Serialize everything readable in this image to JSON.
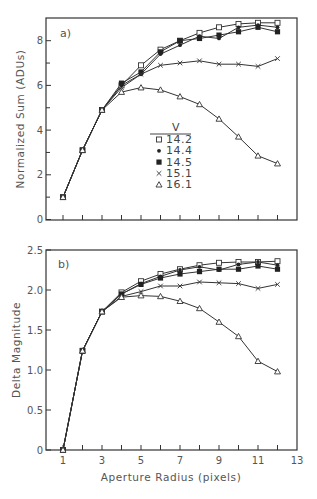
{
  "chart_data": [
    {
      "type": "line",
      "panel_label": "a)",
      "title": "",
      "xlabel": "",
      "ylabel": "Normalized Sum (ADUs)",
      "xlim": [
        0.1,
        13
      ],
      "ylim": [
        0,
        9
      ],
      "yticks": [
        0,
        2,
        4,
        6,
        8
      ],
      "yticks_minor": [
        1,
        3,
        5,
        7
      ],
      "xticks": [
        1,
        2,
        3,
        4,
        5,
        6,
        7,
        8,
        9,
        10,
        11,
        12
      ],
      "grid": false,
      "legend": {
        "title": "V",
        "position": "center",
        "entries": [
          "14.2",
          "14.4",
          "14.5",
          "15.1",
          "16.1"
        ]
      },
      "x": [
        1,
        2,
        3,
        4,
        5,
        6,
        7,
        8,
        9,
        10,
        11,
        12
      ],
      "series": [
        {
          "name": "14.2",
          "marker": "open-square",
          "values": [
            1.0,
            3.1,
            4.9,
            6.0,
            6.9,
            7.6,
            8.0,
            8.35,
            8.6,
            8.75,
            8.8,
            8.8
          ]
        },
        {
          "name": "14.4",
          "marker": "dot",
          "values": [
            1.0,
            3.1,
            4.9,
            6.0,
            6.5,
            7.4,
            7.8,
            8.2,
            8.1,
            8.6,
            8.7,
            8.6
          ]
        },
        {
          "name": "14.5",
          "marker": "filled-square",
          "values": [
            1.0,
            3.1,
            4.9,
            6.1,
            6.6,
            7.5,
            8.0,
            8.1,
            8.25,
            8.4,
            8.6,
            8.4
          ]
        },
        {
          "name": "15.1",
          "marker": "cross",
          "values": [
            1.0,
            3.1,
            4.9,
            5.9,
            6.5,
            6.9,
            7.0,
            7.1,
            6.95,
            6.95,
            6.85,
            7.2
          ]
        },
        {
          "name": "16.1",
          "marker": "open-triangle",
          "values": [
            1.0,
            3.1,
            4.9,
            5.7,
            5.9,
            5.8,
            5.5,
            5.15,
            4.5,
            3.7,
            2.85,
            2.5
          ]
        }
      ]
    },
    {
      "type": "line",
      "panel_label": "b)",
      "title": "",
      "xlabel": "Aperture Radius (pixels)",
      "ylabel": "Delta Magnitude",
      "xlim": [
        0.1,
        13
      ],
      "ylim": [
        0,
        2.5
      ],
      "yticks": [
        0,
        0.5,
        1.0,
        1.5,
        2.0,
        2.5
      ],
      "ytick_labels": [
        "0",
        "0.5",
        "1.0",
        "1.5",
        "2.0",
        "2.5"
      ],
      "xticks": [
        1,
        3,
        5,
        7,
        9,
        11,
        13
      ],
      "xticks_minor": [
        2,
        4,
        6,
        8,
        10,
        12
      ],
      "grid": false,
      "x": [
        1,
        2,
        3,
        4,
        5,
        6,
        7,
        8,
        9,
        10,
        11,
        12
      ],
      "series": [
        {
          "name": "14.2",
          "marker": "open-square",
          "values": [
            0,
            1.24,
            1.73,
            1.97,
            2.11,
            2.2,
            2.26,
            2.31,
            2.34,
            2.35,
            2.35,
            2.36
          ]
        },
        {
          "name": "14.4",
          "marker": "dot",
          "values": [
            0,
            1.24,
            1.73,
            1.95,
            2.08,
            2.17,
            2.25,
            2.29,
            2.25,
            2.32,
            2.35,
            2.31
          ]
        },
        {
          "name": "14.5",
          "marker": "filled-square",
          "values": [
            0,
            1.24,
            1.73,
            1.95,
            2.07,
            2.15,
            2.2,
            2.23,
            2.26,
            2.26,
            2.3,
            2.26
          ]
        },
        {
          "name": "15.1",
          "marker": "cross",
          "values": [
            0,
            1.24,
            1.73,
            1.92,
            1.98,
            2.05,
            2.05,
            2.1,
            2.09,
            2.08,
            2.02,
            2.07
          ]
        },
        {
          "name": "16.1",
          "marker": "open-triangle",
          "values": [
            0,
            1.24,
            1.73,
            1.91,
            1.93,
            1.92,
            1.86,
            1.77,
            1.6,
            1.42,
            1.11,
            0.98
          ]
        }
      ]
    }
  ],
  "legend": {
    "title": "V",
    "entries": [
      {
        "symbol": "□",
        "label": "14.2"
      },
      {
        "symbol": "•",
        "label": "14.4"
      },
      {
        "symbol": "■",
        "label": "14.5"
      },
      {
        "symbol": "×",
        "label": "15.1"
      },
      {
        "symbol": "△",
        "label": "16.1"
      }
    ]
  },
  "panel_a": {
    "label": "a)",
    "ylabel": "Normalized Sum (ADUs)",
    "ytick_labels": [
      "0",
      "2",
      "4",
      "6",
      "8"
    ]
  },
  "panel_b": {
    "label": "b)",
    "ylabel": "Delta Magnitude",
    "xlabel": "Aperture Radius (pixels)",
    "ytick_labels": [
      "0",
      "0.5",
      "1.0",
      "1.5",
      "2.0",
      "2.5"
    ],
    "xtick_labels": [
      "1",
      "3",
      "5",
      "7",
      "9",
      "11",
      "13"
    ]
  }
}
